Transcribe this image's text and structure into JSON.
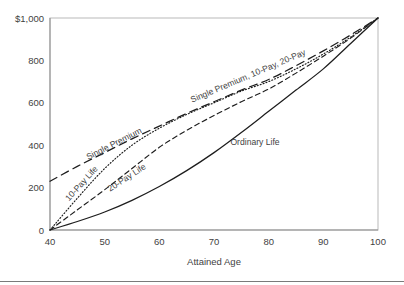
{
  "chart_data": {
    "type": "line",
    "title": "",
    "xlabel": "Attained Age",
    "ylabel": "",
    "xlim": [
      40,
      100
    ],
    "ylim": [
      0,
      1000
    ],
    "grid": false,
    "legend_position": "inline-annotations",
    "x_ticks": [
      "40",
      "50",
      "60",
      "70",
      "80",
      "90",
      "100"
    ],
    "x_tick_values": [
      40,
      50,
      60,
      70,
      80,
      90,
      100
    ],
    "y_ticks": [
      "0",
      "200",
      "400",
      "600",
      "800",
      "$1,000"
    ],
    "y_tick_values": [
      0,
      200,
      400,
      600,
      800,
      1000
    ],
    "x": [
      40,
      45,
      50,
      55,
      60,
      65,
      70,
      75,
      80,
      85,
      90,
      95,
      100
    ],
    "series": [
      {
        "name": "Ordinary Life",
        "style": "solid",
        "label": "Ordinary Life",
        "values": [
          0,
          40,
          85,
          140,
          205,
          280,
          365,
          460,
          560,
          660,
          760,
          880,
          1000
        ]
      },
      {
        "name": "10-Pay Life",
        "style": "dotted",
        "label": "10-Pay Life",
        "values": [
          0,
          150,
          290,
          400,
          480,
          545,
          600,
          655,
          700,
          760,
          830,
          910,
          1000
        ]
      },
      {
        "name": "20-Pay Life",
        "style": "dashed",
        "label": "20-Pay Life",
        "values": [
          0,
          95,
          190,
          290,
          390,
          470,
          540,
          605,
          665,
          740,
          820,
          905,
          1000
        ]
      },
      {
        "name": "Single Premium",
        "style": "long-dashed",
        "label": "Single Premium",
        "values": [
          230,
          300,
          365,
          430,
          490,
          550,
          605,
          660,
          710,
          775,
          845,
          920,
          1000
        ]
      }
    ],
    "annotations": [
      {
        "text": "Single Premium",
        "x": 47,
        "y": 330,
        "rotation": -27
      },
      {
        "text": "10-Pay Life",
        "x": 43.5,
        "y": 135,
        "rotation": -48
      },
      {
        "text": "20-Pay Life",
        "x": 51,
        "y": 180,
        "rotation": -33
      },
      {
        "text": "Single Premium, 10-Pay, 20-Pay",
        "x": 66,
        "y": 600,
        "rotation": -23
      },
      {
        "text": "Ordinary Life",
        "x": 73,
        "y": 400,
        "rotation": 0
      }
    ]
  },
  "axis": {
    "x_title": "Attained Age",
    "y_top_label": "$1,000"
  }
}
